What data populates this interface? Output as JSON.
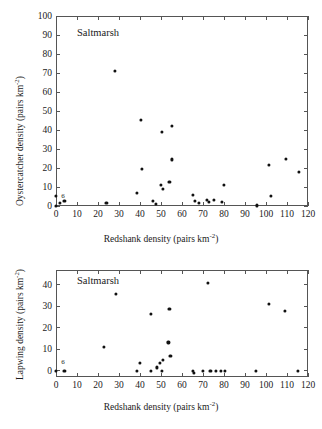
{
  "figure": {
    "background": "#ffffff",
    "marker_color": "#111111",
    "axis_color": "#555555"
  },
  "panels": [
    {
      "id": "oystercatcher",
      "annotation": "Saltmarsh",
      "overlap_label": "6",
      "xlabel_main": "Redshank density (pairs km",
      "xlabel_sup": "-2",
      "xlabel_tail": ")",
      "ylabel_main": "Oystercatcher density (pairs km",
      "ylabel_sup": "-2",
      "ylabel_tail": ")",
      "xticks": [
        "0",
        "10",
        "20",
        "30",
        "40",
        "50",
        "60",
        "70",
        "80",
        "90",
        "100",
        "110",
        "120"
      ],
      "yticks": [
        "0",
        "10",
        "20",
        "30",
        "40",
        "50",
        "60",
        "70",
        "80",
        "90",
        "100"
      ]
    },
    {
      "id": "lapwing",
      "annotation": "Saltmarsh",
      "overlap_label": "6",
      "xlabel_main": "Redshank density (pairs km",
      "xlabel_sup": "-2",
      "xlabel_tail": ")",
      "ylabel_main": "Lapwing density (pairs km",
      "ylabel_sup": "-2",
      "ylabel_tail": ")",
      "xticks": [
        "0",
        "10",
        "20",
        "30",
        "40",
        "50",
        "60",
        "70",
        "80",
        "90",
        "100",
        "110",
        "120"
      ],
      "yticks": [
        "0",
        "10",
        "20",
        "30",
        "40"
      ]
    }
  ],
  "chart_data": [
    {
      "type": "scatter",
      "title": "Saltmarsh",
      "xlabel": "Redshank density (pairs km-2)",
      "ylabel": "Oystercatcher density (pairs km-2)",
      "xlim": [
        0,
        120
      ],
      "ylim": [
        0,
        100
      ],
      "xticks": [
        0,
        10,
        20,
        30,
        40,
        50,
        60,
        70,
        80,
        90,
        100,
        110,
        120
      ],
      "yticks": [
        0,
        10,
        20,
        30,
        40,
        50,
        60,
        70,
        80,
        90,
        100
      ],
      "grid": false,
      "legend": false,
      "annotations": [
        {
          "text": "Saltmarsh",
          "x": 10,
          "y": 91
        },
        {
          "text": "6",
          "x": 2.5,
          "y": 2.5
        }
      ],
      "points": [
        {
          "x": 0,
          "y": 0
        },
        {
          "x": 0,
          "y": 5.5
        },
        {
          "x": 2,
          "y": 1.5
        },
        {
          "x": 4,
          "y": 2.5
        },
        {
          "x": 24,
          "y": 1.8
        },
        {
          "x": 28,
          "y": 71
        },
        {
          "x": 38.5,
          "y": 7
        },
        {
          "x": 40.5,
          "y": 45.5
        },
        {
          "x": 41,
          "y": 19.5
        },
        {
          "x": 46,
          "y": 2.5
        },
        {
          "x": 47.5,
          "y": 1
        },
        {
          "x": 50,
          "y": 11
        },
        {
          "x": 50.5,
          "y": 39
        },
        {
          "x": 51,
          "y": 9
        },
        {
          "x": 54,
          "y": 12.5
        },
        {
          "x": 55,
          "y": 42
        },
        {
          "x": 55,
          "y": 24.5
        },
        {
          "x": 65,
          "y": 6
        },
        {
          "x": 66,
          "y": 2.5
        },
        {
          "x": 68,
          "y": 1.5
        },
        {
          "x": 72,
          "y": 3
        },
        {
          "x": 73,
          "y": 2
        },
        {
          "x": 75,
          "y": 3
        },
        {
          "x": 79,
          "y": 2
        },
        {
          "x": 80,
          "y": 11
        },
        {
          "x": 95.5,
          "y": 0.3
        },
        {
          "x": 101.5,
          "y": 21.8
        },
        {
          "x": 102.5,
          "y": 5.2
        },
        {
          "x": 109.5,
          "y": 24.8
        },
        {
          "x": 115.5,
          "y": 17.8
        }
      ]
    },
    {
      "type": "scatter",
      "title": "Saltmarsh",
      "xlabel": "Redshank density (pairs km-2)",
      "ylabel": "Lapwing density (pairs km-2)",
      "xlim": [
        0,
        120
      ],
      "ylim": [
        -3,
        47
      ],
      "xticks": [
        0,
        10,
        20,
        30,
        40,
        50,
        60,
        70,
        80,
        90,
        100,
        110,
        120
      ],
      "yticks": [
        0,
        10,
        20,
        30,
        40
      ],
      "grid": false,
      "legend": false,
      "annotations": [
        {
          "text": "Saltmarsh",
          "x": 10,
          "y": 42
        },
        {
          "text": "6",
          "x": 2.5,
          "y": 1.8
        }
      ],
      "points": [
        {
          "x": 0,
          "y": 0
        },
        {
          "x": 4,
          "y": 0
        },
        {
          "x": 23,
          "y": 11.2
        },
        {
          "x": 28.5,
          "y": 35.7
        },
        {
          "x": 38.5,
          "y": 0
        },
        {
          "x": 40,
          "y": 3.5
        },
        {
          "x": 45,
          "y": 26.5
        },
        {
          "x": 45,
          "y": 0
        },
        {
          "x": 48,
          "y": 1.5
        },
        {
          "x": 49.5,
          "y": 3.5
        },
        {
          "x": 50.5,
          "y": 0
        },
        {
          "x": 51,
          "y": 5
        },
        {
          "x": 53.5,
          "y": 13.2
        },
        {
          "x": 54,
          "y": 29
        },
        {
          "x": 54.5,
          "y": 6.8
        },
        {
          "x": 65,
          "y": 0
        },
        {
          "x": 65.5,
          "y": -1
        },
        {
          "x": 70,
          "y": 0
        },
        {
          "x": 72.5,
          "y": 41
        },
        {
          "x": 73.5,
          "y": 0
        },
        {
          "x": 76,
          "y": 0
        },
        {
          "x": 78.5,
          "y": 0
        },
        {
          "x": 80.5,
          "y": 0
        },
        {
          "x": 95,
          "y": 0
        },
        {
          "x": 101.5,
          "y": 31
        },
        {
          "x": 109,
          "y": 28
        },
        {
          "x": 115,
          "y": 0
        }
      ]
    }
  ]
}
